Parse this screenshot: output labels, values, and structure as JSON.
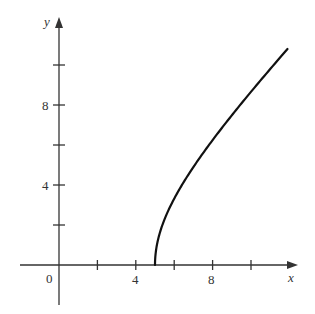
{
  "chart_data": {
    "type": "line",
    "title": "",
    "xlabel": "x",
    "ylabel": "y",
    "function": "y = sqrt(x^2 - 25)",
    "x_ticks": [
      2,
      4,
      6,
      8,
      10
    ],
    "x_tick_labels": [
      {
        "value": 4,
        "label": "4"
      },
      {
        "value": 8,
        "label": "8"
      }
    ],
    "y_ticks": [
      2,
      4,
      6,
      8,
      10
    ],
    "y_tick_labels": [
      {
        "value": 4,
        "label": "4"
      },
      {
        "value": 8,
        "label": "8"
      }
    ],
    "origin_label": "0",
    "xlim": [
      -2,
      12.5
    ],
    "ylim": [
      -2,
      12.4
    ],
    "grid": false,
    "legend": null,
    "series": [
      {
        "name": "curve",
        "x": [
          5,
          5.05,
          5.2,
          5.5,
          6,
          6.5,
          7,
          7.5,
          8,
          8.5,
          9,
          9.5,
          10,
          10.5,
          11,
          11.5,
          11.9
        ],
        "y": [
          0,
          0.71,
          1.43,
          2.29,
          3.32,
          4.15,
          4.9,
          5.59,
          6.24,
          6.87,
          7.48,
          8.08,
          8.66,
          9.23,
          9.8,
          10.36,
          10.8
        ]
      }
    ],
    "colors": {
      "axis": "#333333",
      "curve": "#111111",
      "background": "#ffffff"
    }
  },
  "labels": {
    "x_axis": "x",
    "y_axis": "y",
    "origin": "0",
    "x4": "4",
    "x8": "8",
    "y4": "4",
    "y8": "8"
  }
}
